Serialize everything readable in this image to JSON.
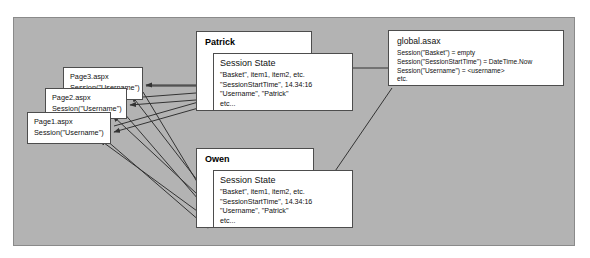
{
  "diagram": {
    "colors": {
      "canvas_background": "#b3b3b3",
      "canvas_border": "#8a8a8a",
      "box_background": "#ffffff",
      "box_border": "#4d4d4d",
      "connector": "#333333",
      "text": "#111111"
    }
  },
  "pages": [
    {
      "id": "page3",
      "file_label": "Page3.aspx",
      "code_label": "Session(\"Username\")"
    },
    {
      "id": "page2",
      "file_label": "Page2.aspx",
      "code_label": "Session(\"Username\")"
    },
    {
      "id": "page1",
      "file_label": "Page1.aspx",
      "code_label": "Session(\"Username\")"
    }
  ],
  "users": [
    {
      "id": "patrick",
      "name": "Patrick",
      "session": {
        "title": "Session State",
        "entries": [
          "\"Basket\", item1, item2, etc.",
          "\"SessionStartTime\", 14.34:16",
          "\"Username\", \"Patrick\"",
          "etc..."
        ]
      }
    },
    {
      "id": "owen",
      "name": "Owen",
      "session": {
        "title": "Session State",
        "entries": [
          "\"Basket\", item1, item2, etc.",
          "\"SessionStartTime\", 14.34:16",
          "\"Username\", \"Patrick\"",
          "etc..."
        ]
      }
    }
  ],
  "global_asax": {
    "title": "global.asax",
    "lines": [
      "Session(\"Basket\") = empty",
      "Session(\"SessionStartTime\") = DateTime.Now",
      "Session(\"Username\") = <username>",
      "etc."
    ]
  }
}
